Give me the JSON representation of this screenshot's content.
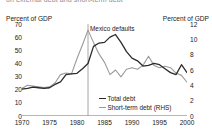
{
  "figure": {
    "clipped_header": "on external debt and short-term debt",
    "annotation": "Mexico defaults",
    "annotation_year": 1982
  },
  "axes": {
    "left_title": "Percent of GDP",
    "right_title": "Percent of GDP",
    "left_ticks": [
      "70",
      "60",
      "50",
      "40",
      "30",
      "20",
      "10",
      "0"
    ],
    "right_ticks": [
      "12",
      "10",
      "8",
      "6",
      "4",
      "2",
      "0"
    ],
    "x_ticks": [
      "1970",
      "1975",
      "1980",
      "1985",
      "1990",
      "1995",
      "2000"
    ]
  },
  "legend": [
    {
      "label": "Total debt",
      "color": "#2b2b2b"
    },
    {
      "label": "Short-term debt (RHS)",
      "color": "#9a9a9a"
    }
  ],
  "chart_data": {
    "type": "line",
    "title": "",
    "xlabel": "",
    "ylabel": "Percent of GDP",
    "y2label": "Percent of GDP",
    "xlim": [
      1970,
      2000
    ],
    "ylim": [
      0,
      70
    ],
    "y2lim": [
      0,
      12
    ],
    "grid": false,
    "legend_position": "inside-center-bottom",
    "annotations": [
      {
        "text": "Mexico defaults",
        "x": 1982,
        "type": "vertical-line-label"
      }
    ],
    "x": [
      1970,
      1971,
      1972,
      1973,
      1974,
      1975,
      1976,
      1977,
      1978,
      1979,
      1980,
      1981,
      1982,
      1983,
      1984,
      1985,
      1986,
      1987,
      1988,
      1989,
      1990,
      1991,
      1992,
      1993,
      1994,
      1995,
      1996,
      1997,
      1998,
      1999,
      2000
    ],
    "series": [
      {
        "name": "Total debt",
        "axis": "left",
        "color": "#2b2b2b",
        "values": [
          20.5,
          21.0,
          22.0,
          21.5,
          21.0,
          21.5,
          24.0,
          26.0,
          31.5,
          32.0,
          32.5,
          36.0,
          40.0,
          53.0,
          55.5,
          56.0,
          60.0,
          62.0,
          56.0,
          49.0,
          44.0,
          42.0,
          38.0,
          38.5,
          40.0,
          39.0,
          36.0,
          33.0,
          31.5,
          39.0,
          33.0
        ]
      },
      {
        "name": "Short-term debt (RHS)",
        "axis": "right",
        "color": "#9a9a9a",
        "values": [
          3.6,
          4.0,
          3.9,
          3.8,
          3.7,
          3.8,
          4.3,
          5.4,
          5.6,
          5.5,
          7.5,
          9.3,
          11.2,
          9.6,
          8.1,
          7.0,
          5.4,
          6.0,
          5.1,
          6.1,
          6.3,
          6.1,
          6.6,
          7.8,
          6.6,
          6.3,
          6.5,
          6.3,
          5.6,
          5.3,
          4.4
        ]
      }
    ]
  }
}
